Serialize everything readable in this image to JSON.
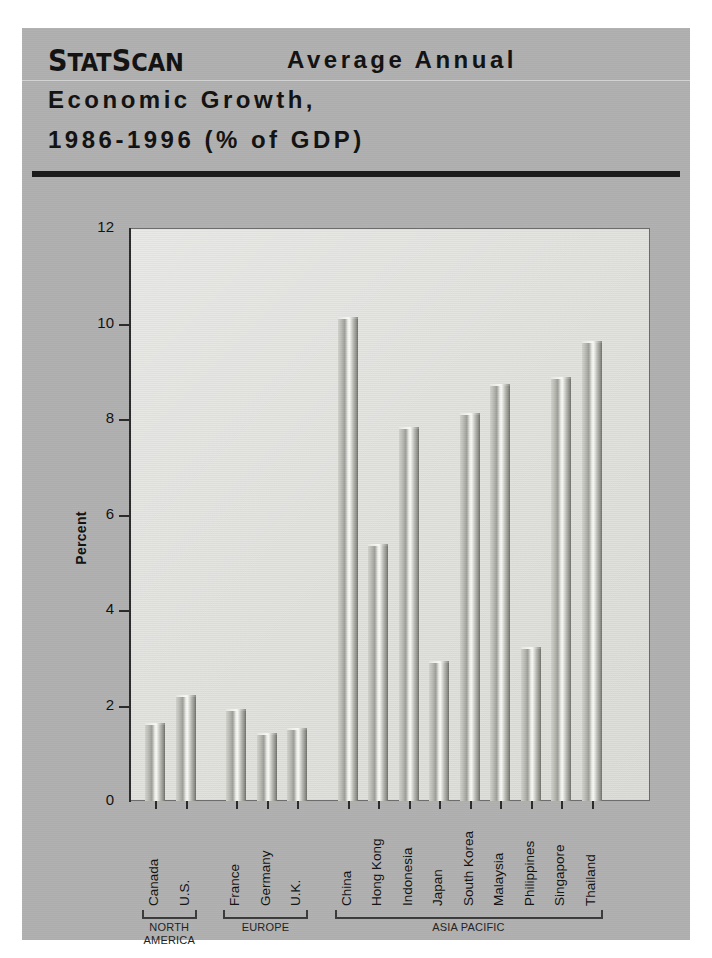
{
  "header": {
    "brand": "StatScan",
    "title_line1": "Average Annual",
    "title_line2": "Economic Growth,",
    "title_line3": "1986-1996 (% of GDP)"
  },
  "colors": {
    "panel_background": "#b0b0b0",
    "plot_background": "#e4e4e1",
    "bar_light": "#f6f6f3",
    "bar_mid": "#bdbdb8",
    "bar_dark": "#6e6e69",
    "axis": "#2a2a2a",
    "rule": "#1a1a1a"
  },
  "chart_data": {
    "type": "bar",
    "title": "StatScan Average Annual Economic Growth, 1986-1996 (% of GDP)",
    "xlabel": "",
    "ylabel": "Percent",
    "ylim": [
      0,
      12
    ],
    "yticks": [
      0,
      2,
      4,
      6,
      8,
      10,
      12
    ],
    "ytick_labels": [
      "0",
      "2",
      "4",
      "6",
      "8",
      "10",
      "12"
    ],
    "grid": false,
    "legend": "none",
    "categories": [
      "Canada",
      "U.S.",
      "France",
      "Germany",
      "U.K.",
      "China",
      "Hong Kong",
      "Indonesia",
      "Japan",
      "South Korea",
      "Malaysia",
      "Philippines",
      "Singapore",
      "Thailand"
    ],
    "values": [
      1.65,
      2.25,
      1.95,
      1.45,
      1.55,
      10.15,
      5.4,
      7.85,
      2.95,
      8.15,
      8.75,
      3.25,
      8.9,
      9.65
    ],
    "groups": [
      {
        "label": "NORTH AMERICA",
        "categories": [
          "Canada",
          "U.S."
        ]
      },
      {
        "label": "EUROPE",
        "categories": [
          "France",
          "Germany",
          "U.K."
        ]
      },
      {
        "label": "ASIA PACIFIC",
        "categories": [
          "China",
          "Hong Kong",
          "Indonesia",
          "Japan",
          "South Korea",
          "Malaysia",
          "Philippines",
          "Singapore",
          "Thailand"
        ]
      }
    ]
  }
}
